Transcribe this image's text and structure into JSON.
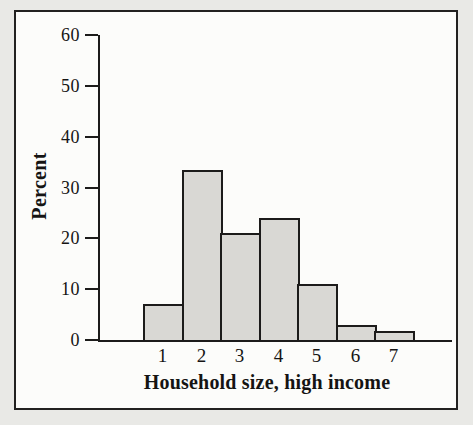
{
  "page": {
    "background": "#e9e9e6",
    "text_color": "#151413"
  },
  "frame": {
    "background": "#fcfcfa",
    "border_color": "#222120"
  },
  "chart_data": {
    "type": "bar",
    "title": "",
    "xlabel": "Household size, high income",
    "ylabel": "Percent",
    "categories": [
      "1",
      "2",
      "3",
      "4",
      "5",
      "6",
      "7"
    ],
    "values": [
      7,
      33.5,
      21,
      24,
      11,
      3,
      1.8
    ],
    "yticks": [
      0,
      10,
      20,
      30,
      40,
      50,
      60
    ],
    "ylim": [
      0,
      60
    ],
    "grid": false,
    "legend_position": "none",
    "bar_fill": "#d9d8d4",
    "bar_border": "#1c1b1a",
    "axis_color": "#1c1b1a"
  }
}
